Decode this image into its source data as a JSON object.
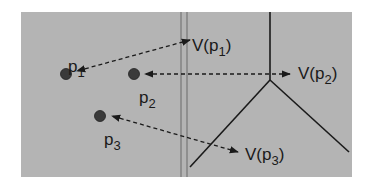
{
  "colors": {
    "background": "#ffffff",
    "panel": "#b4b4b4",
    "ink": "#1a1a1a",
    "point": "#3a3a3a"
  },
  "panel": {
    "x": 21,
    "y": 12,
    "width": 331,
    "height": 165
  },
  "divider": {
    "x1": 181,
    "x2": 187,
    "y1": 12,
    "y2": 177
  },
  "points": [
    {
      "id": "p1",
      "label": "p",
      "sub": "1",
      "cx": 66,
      "cy": 74,
      "label_x": 68,
      "label_y": 72
    },
    {
      "id": "p2",
      "label": "p",
      "sub": "2",
      "cx": 134,
      "cy": 74,
      "label_x": 139,
      "label_y": 103
    },
    {
      "id": "p3",
      "label": "p",
      "sub": "3",
      "cx": 100,
      "cy": 116,
      "label_x": 104,
      "label_y": 145
    }
  ],
  "regions": [
    {
      "id": "V-p1",
      "label": "V(p",
      "sub": "1",
      "close": ")",
      "x": 192,
      "y": 51,
      "arrow_from": [
        190,
        40
      ],
      "arrow_to": [
        77,
        71
      ],
      "head_at_label": true
    },
    {
      "id": "V-p2",
      "label": "V(p",
      "sub": "2",
      "close": ")",
      "x": 298,
      "y": 79,
      "arrow_from": [
        290,
        74
      ],
      "arrow_to": [
        145,
        74
      ],
      "head_at_label": true
    },
    {
      "id": "V-p3",
      "label": "V(p",
      "sub": "3",
      "close": ")",
      "x": 245,
      "y": 160,
      "arrow_from": [
        238,
        152
      ],
      "arrow_to": [
        112,
        116
      ],
      "head_at_label": true
    }
  ],
  "voronoi_edges": [
    {
      "x1": 270,
      "y1": 12,
      "x2": 270,
      "y2": 80
    },
    {
      "x1": 270,
      "y1": 80,
      "x2": 190,
      "y2": 167
    },
    {
      "x1": 270,
      "y1": 80,
      "x2": 349,
      "y2": 152
    }
  ]
}
